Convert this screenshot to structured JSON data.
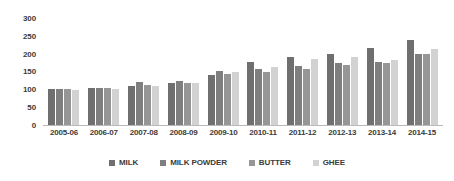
{
  "chart_data": {
    "type": "bar",
    "title": "",
    "xlabel": "",
    "ylabel": "",
    "ylim": [
      0,
      300
    ],
    "yticks": [
      0,
      50,
      100,
      150,
      200,
      250,
      300
    ],
    "ytick_labels": [
      "0",
      "50",
      "100",
      "150",
      "200",
      "250",
      "300"
    ],
    "grid": false,
    "legend_position": "bottom",
    "categories": [
      "2005-06",
      "2006-07",
      "2007-08",
      "2008-09",
      "2009-10",
      "2010-11",
      "2011-12",
      "2012-13",
      "2013-14",
      "2014-15"
    ],
    "series": [
      {
        "name": "MILK",
        "color": "#6f6f6f",
        "values": [
          100,
          104,
          110,
          117,
          140,
          178,
          192,
          199,
          215,
          237
        ]
      },
      {
        "name": "MILK POWDER",
        "color": "#7f7f7f",
        "values": [
          100,
          104,
          120,
          124,
          152,
          156,
          165,
          173,
          177,
          200
        ]
      },
      {
        "name": "BUTTER",
        "color": "#969696",
        "values": [
          100,
          104,
          112,
          117,
          144,
          150,
          157,
          167,
          175,
          200
        ]
      },
      {
        "name": "GHEE",
        "color": "#d2d2d2",
        "values": [
          98,
          101,
          108,
          119,
          150,
          163,
          184,
          190,
          183,
          213
        ]
      }
    ]
  },
  "legend": {
    "items": [
      {
        "label": "MILK"
      },
      {
        "label": "MILK POWDER"
      },
      {
        "label": "BUTTER"
      },
      {
        "label": "GHEE"
      }
    ]
  },
  "axis": {
    "y_labels": [
      "300",
      "250",
      "200",
      "150",
      "100",
      "50",
      "0"
    ]
  }
}
